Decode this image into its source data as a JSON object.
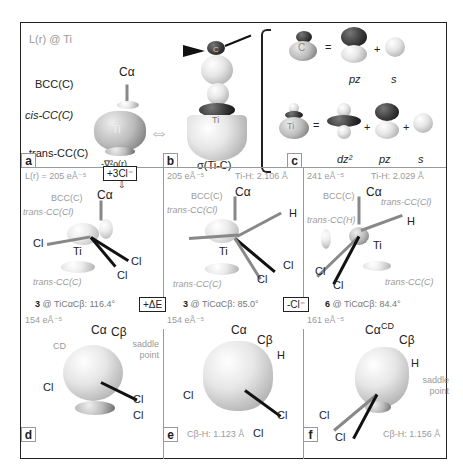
{
  "panel_a_top": {
    "title": "L(r) @ Ti",
    "labels": {
      "calpha": "Cα",
      "bcc": "BCC(C)",
      "cis": "cis-CC(C)",
      "trans": "trans-CC(C)",
      "ti": "Ti"
    },
    "caption": "-∇²ρ(r)",
    "letter": "a"
  },
  "panel_b_top": {
    "caption": "σ(Ti-C)",
    "ti": "Ti",
    "c": "C",
    "letter": "b"
  },
  "panel_c_top": {
    "letter": "c",
    "row1": {
      "atom": "C",
      "eq": "=",
      "plus": "+",
      "labels": [
        "pz",
        "s"
      ]
    },
    "row2": {
      "atom": "Ti",
      "eq": "=",
      "plus1": "+",
      "plus2": "+",
      "labels": [
        "dz²",
        "pz",
        "s"
      ]
    }
  },
  "panel_a": {
    "header": "L(r) = 205 eÅ⁻⁵",
    "action": "+3Cl⁻",
    "labels": {
      "calpha": "Cα",
      "bcc": "BCC(C)",
      "trans_cl": "trans-CC(Cl)",
      "trans_c": "trans-CC(C)",
      "ti": "Ti",
      "cl1": "Cl",
      "cl2": "Cl",
      "cl3": "Cl"
    },
    "footer_bold": "3",
    "footer": " @ TiCαCβ: 116.4°"
  },
  "panel_b": {
    "header_left": "205 eÅ⁻⁵",
    "header_right": "Ti-H: 2.106 Å",
    "labels": {
      "calpha": "Cα",
      "bcc": "BCC(C)",
      "trans_cl": "trans-CC(Cl)",
      "trans_c": "trans-CC(C)",
      "ti": "Ti",
      "h": "H",
      "cl1": "Cl",
      "cl2": "Cl"
    },
    "action": "+ΔE",
    "footer_bold": "3",
    "footer": " @ TiCαCβ: 85.0°"
  },
  "panel_c": {
    "header_left": "241 eÅ⁻⁵",
    "header_right": "Ti-H: 2.029 Å",
    "labels": {
      "calpha": "Cα",
      "bcc": "BCC(C)",
      "trans_cl": "trans-CC(Cl)",
      "trans_h": "trans-CC(H)",
      "trans_c": "trans-CC(C)",
      "ti": "Ti",
      "h": "H",
      "cl1": "Cl",
      "cl2": "Cl"
    },
    "action": "-Cl⁻",
    "footer_bold": "6",
    "footer": " @ TiCαCβ: 84.4°"
  },
  "panel_d": {
    "letter": "d",
    "header": "154 eÅ⁻⁵",
    "labels": {
      "calpha": "Cα",
      "cbeta": "Cβ",
      "cd": "CD",
      "saddle": "saddle point",
      "cl1": "Cl",
      "cl2": "Cl",
      "cl3": "Cl"
    }
  },
  "panel_e": {
    "letter": "e",
    "header": "154 eÅ⁻⁵",
    "labels": {
      "calpha": "Cα",
      "cbeta": "Cβ",
      "h": "H",
      "cl1": "Cl",
      "cl2": "Cl",
      "cl3": "Cl"
    },
    "footer": "Cβ-H: 1.123 Å"
  },
  "panel_f": {
    "letter": "f",
    "header": "161 eÅ⁻⁵",
    "labels": {
      "calpha": "Cα",
      "cbeta": "Cβ",
      "cd": "CD",
      "h": "H",
      "saddle": "saddle point",
      "cl1": "Cl",
      "cl2": "Cl"
    },
    "footer": "Cβ-H: 1.156 Å"
  }
}
